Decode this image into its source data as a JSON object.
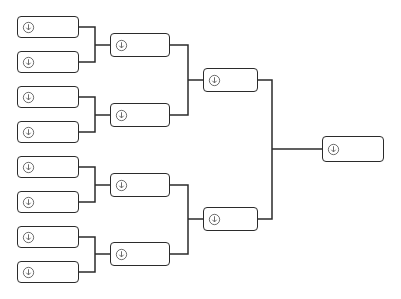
{
  "view": {
    "title": "Tournament Bracket",
    "width": 401,
    "height": 299,
    "background_color": "#ffffff",
    "line_color": "#2b2b2b",
    "box_fill_color": "#ffffff",
    "box_border_color": "#2b2b2b"
  },
  "icon": {
    "name": "circled-down-arrow-icon",
    "glyph": "⬇",
    "color": "#555555"
  },
  "rounds": [
    {
      "name": "round-of-16",
      "label": "Round 1",
      "box_width": 62,
      "box_height": 22,
      "x": 17,
      "slots": [
        {
          "id": "r1-s1",
          "label": "",
          "center_y": 27
        },
        {
          "id": "r1-s2",
          "label": "",
          "center_y": 62
        },
        {
          "id": "r1-s3",
          "label": "",
          "center_y": 97
        },
        {
          "id": "r1-s4",
          "label": "",
          "center_y": 132
        },
        {
          "id": "r1-s5",
          "label": "",
          "center_y": 167
        },
        {
          "id": "r1-s6",
          "label": "",
          "center_y": 202
        },
        {
          "id": "r1-s7",
          "label": "",
          "center_y": 237
        },
        {
          "id": "r1-s8",
          "label": "",
          "center_y": 272
        }
      ]
    },
    {
      "name": "quarterfinals",
      "label": "Round 2",
      "box_width": 60,
      "box_height": 24,
      "x": 110,
      "slots": [
        {
          "id": "r2-s1",
          "label": "",
          "center_y": 45
        },
        {
          "id": "r2-s2",
          "label": "",
          "center_y": 115
        },
        {
          "id": "r2-s3",
          "label": "",
          "center_y": 185
        },
        {
          "id": "r2-s4",
          "label": "",
          "center_y": 254
        }
      ]
    },
    {
      "name": "semifinals",
      "label": "Semifinals",
      "box_width": 55,
      "box_height": 24,
      "x": 203,
      "slots": [
        {
          "id": "r3-s1",
          "label": "",
          "center_y": 80
        },
        {
          "id": "r3-s2",
          "label": "",
          "center_y": 219
        }
      ]
    },
    {
      "name": "final",
      "label": "Final",
      "box_width": 62,
      "box_height": 26,
      "x": 322,
      "slots": [
        {
          "id": "r4-s1",
          "label": "",
          "center_y": 149
        }
      ]
    }
  ],
  "connectors": [
    {
      "id": "c1-1",
      "from_y": 27,
      "to_y": 62,
      "stub_x": 79,
      "join_x": 95,
      "feed_x": 110,
      "mid_y": 45
    },
    {
      "id": "c1-2",
      "from_y": 97,
      "to_y": 132,
      "stub_x": 79,
      "join_x": 95,
      "feed_x": 110,
      "mid_y": 115
    },
    {
      "id": "c1-3",
      "from_y": 167,
      "to_y": 202,
      "stub_x": 79,
      "join_x": 95,
      "feed_x": 110,
      "mid_y": 185
    },
    {
      "id": "c1-4",
      "from_y": 237,
      "to_y": 272,
      "stub_x": 79,
      "join_x": 95,
      "feed_x": 110,
      "mid_y": 254
    },
    {
      "id": "c2-1",
      "from_y": 45,
      "to_y": 115,
      "stub_x": 170,
      "join_x": 188,
      "feed_x": 203,
      "mid_y": 80
    },
    {
      "id": "c2-2",
      "from_y": 185,
      "to_y": 254,
      "stub_x": 170,
      "join_x": 188,
      "feed_x": 203,
      "mid_y": 219
    },
    {
      "id": "c3-1",
      "from_y": 80,
      "to_y": 219,
      "stub_x": 258,
      "join_x": 272,
      "feed_x": 322,
      "mid_y": 149
    }
  ]
}
